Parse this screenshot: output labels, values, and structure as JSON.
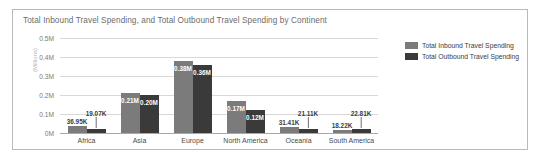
{
  "card": {
    "title": "Total Inbound Travel Spending, and Total Outbound Travel Spending by Continent",
    "border_color": "#b9b9b9",
    "background": "#ffffff"
  },
  "legend": {
    "position": "right",
    "items": [
      {
        "label": "Total Inbound Travel Spending",
        "color": "#7b7b7b",
        "swatch": "inbound-swatch"
      },
      {
        "label": "Total Outbound Travel Spending",
        "color": "#3a3a3a",
        "swatch": "outbound-swatch"
      }
    ]
  },
  "axes": {
    "y_title": "(Millions)",
    "y_ticks": [
      "0M",
      "0.1M",
      "0.2M",
      "0.3M",
      "0.4M",
      "0.5M"
    ],
    "y_tick_values": [
      0,
      100000,
      200000,
      300000,
      400000,
      500000
    ],
    "x_categories": [
      "Africa",
      "Asia",
      "Europe",
      "North America",
      "Oceania",
      "South America"
    ]
  },
  "chart_data": {
    "type": "bar",
    "title": "Total Inbound Travel Spending, and Total Outbound Travel Spending by Continent",
    "xlabel": "",
    "ylabel": "(Millions)",
    "ylim": [
      0,
      500000
    ],
    "grid": true,
    "legend_position": "right",
    "categories": [
      "Africa",
      "Asia",
      "Europe",
      "North America",
      "Oceania",
      "South America"
    ],
    "series": [
      {
        "name": "Total Inbound Travel Spending",
        "color": "#7b7b7b",
        "values": [
          36950,
          210000,
          380000,
          170000,
          31410,
          18220
        ],
        "labels": [
          "36.95K",
          "0.21M",
          "0.38M",
          "0.17M",
          "31.41K",
          "18.22K"
        ]
      },
      {
        "name": "Total Outbound Travel Spending",
        "color": "#3a3a3a",
        "values": [
          19070,
          200000,
          360000,
          120000,
          21110,
          22810
        ],
        "labels": [
          "19.07K",
          "0.20M",
          "0.36M",
          "0.12M",
          "21.11K",
          "22.81K"
        ]
      }
    ]
  }
}
